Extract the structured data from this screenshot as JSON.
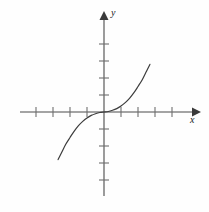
{
  "chart_data": {
    "type": "line",
    "title": "",
    "subtitle": "",
    "xlabel": "x",
    "ylabel": "y",
    "function_label": "y = x^3",
    "xlim": [
      -5,
      5
    ],
    "ylim": [
      -5,
      5
    ],
    "grid": false,
    "legend": null,
    "axes": {
      "x_tick_count_negative": 4,
      "x_tick_count_positive": 4,
      "y_tick_count_positive": 4,
      "y_tick_count_negative": 4,
      "x_ticks": [
        -4,
        -3,
        -2,
        -1,
        1,
        2,
        3,
        4
      ],
      "y_ticks": [
        -4,
        -3,
        -2,
        -1,
        1,
        2,
        3,
        4
      ],
      "tick_labels_shown": false,
      "arrowheads": [
        "x-positive",
        "y-positive"
      ]
    },
    "x": [
      -2.7,
      -2.5,
      -2.25,
      -2.0,
      -1.75,
      -1.5,
      -1.25,
      -1.0,
      -0.75,
      -0.5,
      -0.25,
      0,
      0.25,
      0.5,
      0.75,
      1.0,
      1.25,
      1.5,
      1.75,
      2.0,
      2.25,
      2.5,
      2.7
    ],
    "y": [
      -2.8,
      -2.4,
      -1.9,
      -1.5,
      -1.12,
      -0.8,
      -0.55,
      -0.35,
      -0.2,
      -0.1,
      -0.03,
      0,
      0.03,
      0.1,
      0.2,
      0.35,
      0.55,
      0.8,
      1.12,
      1.5,
      1.9,
      2.4,
      2.8
    ],
    "series": [
      {
        "name": "cubic-curve",
        "color": "#3c3c3c",
        "x": [
          -2.7,
          -2.5,
          -2.25,
          -2.0,
          -1.75,
          -1.5,
          -1.25,
          -1.0,
          -0.75,
          -0.5,
          -0.25,
          0,
          0.25,
          0.5,
          0.75,
          1.0,
          1.25,
          1.5,
          1.75,
          2.0,
          2.25,
          2.5,
          2.7
        ],
        "y": [
          -2.8,
          -2.4,
          -1.9,
          -1.5,
          -1.12,
          -0.8,
          -0.55,
          -0.35,
          -0.2,
          -0.1,
          -0.03,
          0,
          0.03,
          0.1,
          0.2,
          0.35,
          0.55,
          0.8,
          1.12,
          1.5,
          1.9,
          2.4,
          2.8
        ]
      }
    ]
  },
  "figure": {
    "background_color": "#fefefe",
    "axis_color": "#4a4a4a",
    "curve_color": "#3c3c3c",
    "tick_color": "#6e6e6e"
  },
  "labels": {
    "x": "x",
    "y": "y"
  }
}
